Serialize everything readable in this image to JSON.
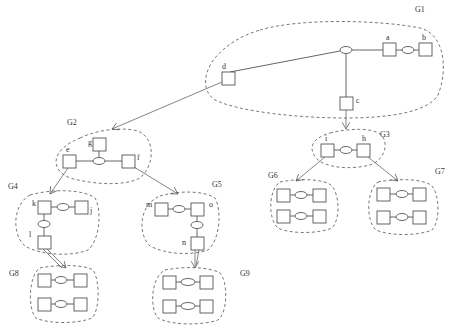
{
  "diagram": {
    "groups": [
      {
        "id": "G1",
        "label": "G1"
      },
      {
        "id": "G2",
        "label": "G2"
      },
      {
        "id": "G3",
        "label": "G3"
      },
      {
        "id": "G4",
        "label": "G4"
      },
      {
        "id": "G5",
        "label": "G5"
      },
      {
        "id": "G6",
        "label": "G6"
      },
      {
        "id": "G7",
        "label": "G7"
      },
      {
        "id": "G8",
        "label": "G8"
      },
      {
        "id": "G9",
        "label": "G9"
      }
    ],
    "nodes": {
      "a": "a",
      "b": "b",
      "c": "c",
      "d": "d",
      "e": "e",
      "f": "f",
      "g": "g",
      "h": "h",
      "i": "i",
      "j": "j",
      "k": "k",
      "l": "l",
      "m": "m",
      "n": "n",
      "o": "o"
    },
    "edges": [
      {
        "from": "G1",
        "to": "G2",
        "via": "d"
      },
      {
        "from": "G1",
        "to": "G3",
        "via": "c"
      },
      {
        "from": "G2",
        "to": "G4",
        "via": "e"
      },
      {
        "from": "G2",
        "to": "G5",
        "via": "f"
      },
      {
        "from": "G3",
        "to": "G6",
        "via": "i"
      },
      {
        "from": "G3",
        "to": "G7",
        "via": "h"
      },
      {
        "from": "G4",
        "to": "G8",
        "via": "l"
      },
      {
        "from": "G5",
        "to": "G9",
        "via": "n"
      }
    ]
  }
}
